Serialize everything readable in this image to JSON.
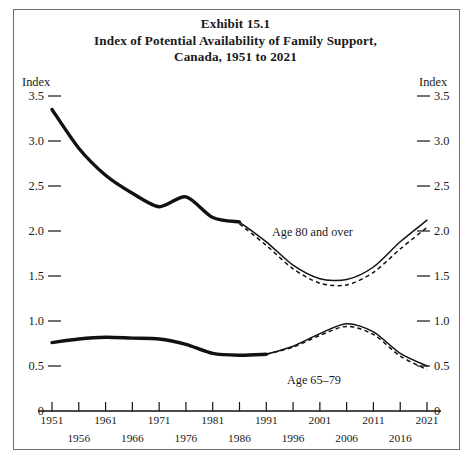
{
  "figure": {
    "title_lines": [
      "Exhibit 15.1",
      "Index of Potential Availability of Family Support,",
      "Canada, 1951 to 2021"
    ],
    "border_color": "#6e6e72",
    "line_color": "#111111"
  },
  "axes": {
    "left_name": "Index",
    "right_name": "Index",
    "ytick_labels": [
      "3.5",
      "3.0",
      "2.5",
      "2.0",
      "1.5",
      "1.0",
      "0.5",
      "0"
    ],
    "xtick_labels": [
      "1951",
      "1956",
      "1961",
      "1966",
      "1971",
      "1976",
      "1981",
      "1986",
      "1991",
      "1996",
      "2001",
      "2006",
      "2011",
      "2016",
      "2021"
    ],
    "x_origin_label": "0",
    "x_end_label": "0"
  },
  "series_labels": {
    "age80": "Age 80 and over",
    "age6579": "Age 65–79"
  },
  "chart_data": {
    "type": "line",
    "xlabel": "",
    "ylabel": "Index",
    "xlim": [
      1951,
      2021
    ],
    "ylim": [
      0,
      3.5
    ],
    "ytick_values": [
      3.5,
      3.0,
      2.5,
      2.0,
      1.5,
      1.0,
      0.5,
      0
    ],
    "grid": false,
    "legend": "inline-annotations",
    "x": [
      1951,
      1956,
      1961,
      1966,
      1971,
      1976,
      1981,
      1986,
      1991,
      1996,
      2001,
      2006,
      2011,
      2016,
      2021
    ],
    "series": [
      {
        "name": "Age 80 and over",
        "style": "solid",
        "observed_through": 1986,
        "values": [
          3.35,
          2.92,
          2.62,
          2.42,
          2.27,
          2.38,
          2.15,
          2.1,
          1.88,
          1.62,
          1.47,
          1.46,
          1.6,
          1.88,
          2.12
        ]
      },
      {
        "name": "Age 80 and over (alternate projection)",
        "style": "dashed",
        "projection_from": 1986,
        "values": [
          null,
          null,
          null,
          null,
          null,
          null,
          null,
          2.08,
          1.84,
          1.58,
          1.42,
          1.4,
          1.54,
          1.8,
          2.04
        ]
      },
      {
        "name": "Age 65–79",
        "style": "solid",
        "observed_through": 1991,
        "values": [
          0.76,
          0.8,
          0.82,
          0.81,
          0.8,
          0.74,
          0.64,
          0.62,
          0.63,
          0.72,
          0.86,
          0.97,
          0.88,
          0.64,
          0.5
        ]
      },
      {
        "name": "Age 65–79 (alternate projection)",
        "style": "dashed",
        "projection_from": 1991,
        "values": [
          null,
          null,
          null,
          null,
          null,
          null,
          null,
          null,
          0.63,
          0.71,
          0.84,
          0.94,
          0.85,
          0.61,
          0.46
        ]
      }
    ]
  }
}
